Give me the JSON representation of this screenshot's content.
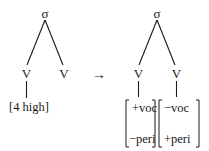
{
  "diagram": {
    "type": "phonological-feature-tree-rule",
    "left_tree": {
      "root": "σ",
      "children": [
        {
          "label": "V",
          "features": [
            "[4 high]"
          ]
        },
        {
          "label": "V",
          "features": []
        }
      ]
    },
    "arrow": "→",
    "right_tree": {
      "root": "σ",
      "children": [
        {
          "label": "V",
          "matrix": [
            "+voc",
            "−peri"
          ]
        },
        {
          "label": "V",
          "matrix": [
            "−voc",
            "+peri"
          ]
        }
      ]
    },
    "colors": {
      "ink": "#1a1a1a",
      "background": "#ffffff"
    }
  }
}
